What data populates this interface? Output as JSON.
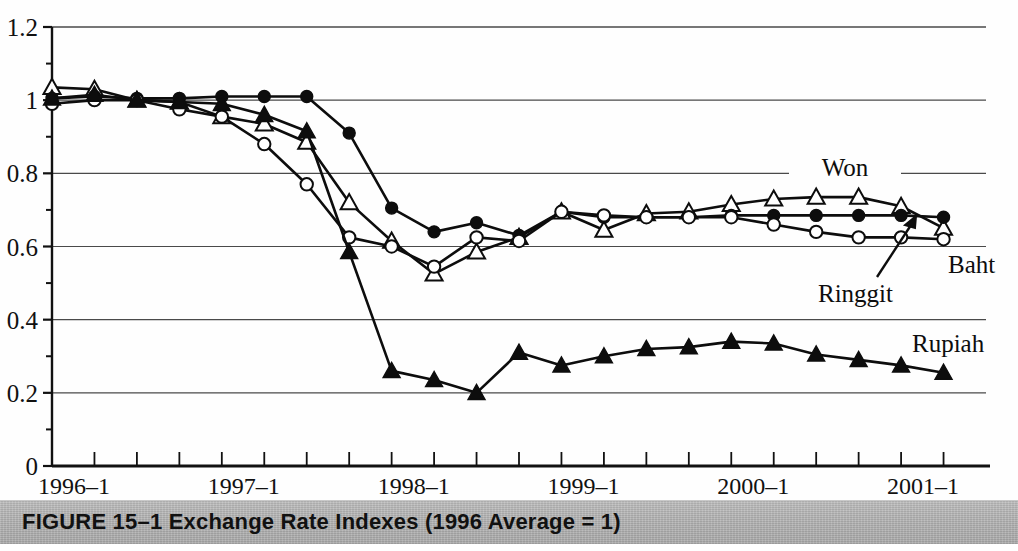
{
  "figure": {
    "caption": "FIGURE 15–1  Exchange Rate Indexes (1996 Average = 1)",
    "caption_band_color": "#b3b3b3"
  },
  "chart_data": {
    "type": "line",
    "title": "Exchange Rate Indexes (1996 Average = 1)",
    "xlabel": "",
    "ylabel": "",
    "ylim": [
      0,
      1.2
    ],
    "ytick_values": [
      0,
      0.2,
      0.4,
      0.6,
      0.8,
      1,
      1.2
    ],
    "ytick_labels": [
      "0",
      "0.2",
      "0.4",
      "0.6",
      "0.8",
      "1",
      "1.2"
    ],
    "yminor_tick_values": [
      0.1,
      0.3,
      0.5,
      0.7,
      0.9,
      1.1
    ],
    "grid": "horizontal",
    "legend_position": "inline-annotations",
    "x": [
      "1996-1",
      "1996-2",
      "1996-3",
      "1996-4",
      "1997-1",
      "1997-2",
      "1997-3",
      "1997-4",
      "1998-1",
      "1998-2",
      "1998-3",
      "1998-4",
      "1999-1",
      "1999-2",
      "1999-3",
      "1999-4",
      "2000-1",
      "2000-2",
      "2000-3",
      "2000-4",
      "2001-1",
      "2001-2"
    ],
    "xtick_labels": [
      "1996–1",
      "1997–1",
      "1998–1",
      "1999–1",
      "2000–1",
      "2001–1"
    ],
    "xtick_label_indices": [
      0,
      4,
      8,
      12,
      16,
      20
    ],
    "series": [
      {
        "name": "Won",
        "marker": "open-triangle",
        "annotation": "Won",
        "values": [
          1.035,
          1.03,
          1.0,
          0.995,
          0.955,
          0.935,
          0.885,
          0.72,
          0.615,
          0.525,
          0.585,
          0.625,
          0.695,
          0.645,
          0.69,
          0.695,
          0.715,
          0.73,
          0.735,
          0.735,
          0.71,
          0.65
        ]
      },
      {
        "name": "Ringgit",
        "marker": "filled-circle",
        "annotation": "Ringgit",
        "values": [
          1.005,
          1.01,
          1.005,
          1.005,
          1.01,
          1.01,
          1.01,
          0.91,
          0.705,
          0.64,
          0.665,
          0.63,
          0.695,
          0.68,
          0.68,
          0.68,
          0.685,
          0.685,
          0.685,
          0.685,
          0.685,
          0.68
        ]
      },
      {
        "name": "Baht",
        "marker": "open-circle",
        "annotation": "Baht",
        "values": [
          0.99,
          1.0,
          1.0,
          0.975,
          0.955,
          0.88,
          0.77,
          0.625,
          0.6,
          0.545,
          0.625,
          0.615,
          0.695,
          0.685,
          0.68,
          0.68,
          0.68,
          0.66,
          0.64,
          0.625,
          0.625,
          0.62
        ]
      },
      {
        "name": "Rupiah",
        "marker": "filled-triangle",
        "annotation": "Rupiah",
        "values": [
          1.005,
          1.015,
          1.0,
          0.995,
          0.99,
          0.96,
          0.915,
          0.585,
          0.26,
          0.235,
          0.2,
          0.31,
          0.275,
          0.3,
          0.32,
          0.325,
          0.34,
          0.335,
          0.305,
          0.29,
          0.275,
          0.255
        ]
      }
    ]
  }
}
